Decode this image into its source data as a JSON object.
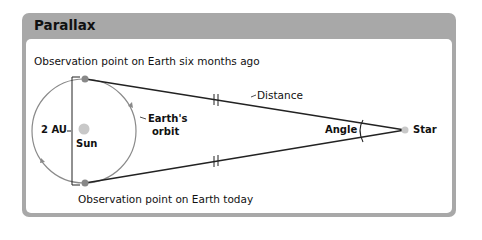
{
  "title": "Parallax",
  "labels": {
    "top_observation": "Observation point on Earth six months ago",
    "bottom_observation": "Observation point on Earth today",
    "distance": "Distance",
    "two_au": "2 AU",
    "earths_orbit_line1": "Earth's",
    "earths_orbit_line2": "orbit",
    "sun": "Sun",
    "angle": "Angle",
    "star": "Star"
  },
  "colors": {
    "frame": "#a8a8a8",
    "orbit": "#888888",
    "sun": "#c8c8c8",
    "earth": "#888888",
    "star": "#c8c8c8",
    "line": "#222222"
  }
}
